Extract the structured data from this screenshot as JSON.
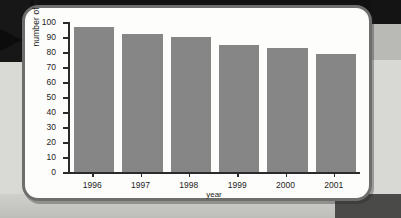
{
  "figure": {
    "frame_color": "#6e6e6c",
    "card_background": "#fdfdfc",
    "page_background": "#d8d8d5",
    "marker_icon": "right-arrow-icon"
  },
  "chart_data": {
    "type": "bar",
    "title": "",
    "categories": [
      "1996",
      "1997",
      "1998",
      "1999",
      "2000",
      "2001"
    ],
    "values": [
      97,
      92,
      90,
      85,
      83,
      79
    ],
    "xlabel": "year",
    "ylabel": "number of orcas",
    "ylim": [
      0,
      100
    ],
    "ytick_labels": [
      "0",
      "10",
      "20",
      "30",
      "40",
      "50",
      "60",
      "70",
      "80",
      "90",
      "100"
    ],
    "ytick_values": [
      0,
      10,
      20,
      30,
      40,
      50,
      60,
      70,
      80,
      90,
      100
    ],
    "grid": false,
    "legend": null,
    "bar_color": "#868686",
    "axis_color": "#2b2b2b"
  }
}
